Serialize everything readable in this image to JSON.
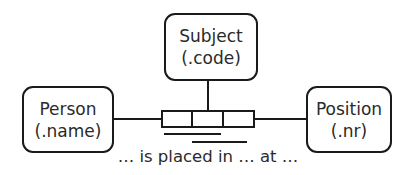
{
  "entities": {
    "subject": {
      "name": "Subject",
      "ref": "(.code)"
    },
    "person": {
      "name": "Person",
      "ref": "(.name)"
    },
    "position": {
      "name": "Position",
      "ref": "(.nr)"
    }
  },
  "fact_type": {
    "roles": 3,
    "reading": "… is placed in … at …"
  },
  "colors": {
    "stroke": "#1a1a1a",
    "background": "#ffffff"
  }
}
